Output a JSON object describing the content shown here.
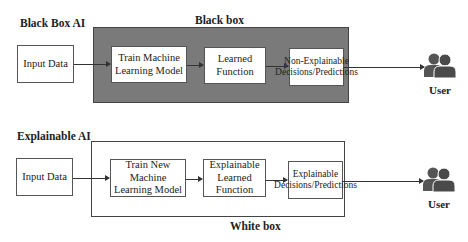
{
  "black_box_ai": {
    "section_title": "Black Box AI",
    "container_label": "Black box",
    "container_color": "#7a7a7a",
    "nodes": [
      {
        "id": "input",
        "label": "Input Data"
      },
      {
        "id": "train",
        "label": "Train Machine Learning Model"
      },
      {
        "id": "function",
        "label": "Learned Function"
      },
      {
        "id": "decisions",
        "label": "Non-Explainable Decisions/Predictions"
      }
    ],
    "user": {
      "label": "User",
      "icon": "users-icon"
    }
  },
  "explainable_ai": {
    "section_title": "Explainable AI",
    "container_label": "White box",
    "container_color": "#ffffff",
    "nodes": [
      {
        "id": "input",
        "label": "Input Data"
      },
      {
        "id": "train",
        "label": "Train New Machine Learning Model"
      },
      {
        "id": "function",
        "label": "Explainable Learned Function"
      },
      {
        "id": "decisions",
        "label": "Explainable Decisions/Predictions"
      }
    ],
    "user": {
      "label": "User",
      "icon": "users-icon"
    }
  },
  "edges": [
    [
      "input",
      "train"
    ],
    [
      "train",
      "function"
    ],
    [
      "function",
      "decisions"
    ],
    [
      "decisions",
      "user"
    ]
  ]
}
